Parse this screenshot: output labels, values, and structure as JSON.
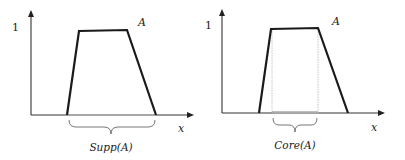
{
  "left_panel": {
    "y_tick_label": "1",
    "set_label": "A",
    "x_axis_label": "x",
    "brace_caption": "Supp(A)",
    "axis_origin": [
      31,
      115
    ],
    "y_axis_top": 11,
    "x_axis_end": 193,
    "trapezoid": {
      "bottom_left": [
        67,
        115
      ],
      "top_left": [
        79,
        31
      ],
      "top_right": [
        127,
        30
      ],
      "bottom_right": [
        156,
        115
      ]
    },
    "highlight_range": [
      67,
      156
    ]
  },
  "right_panel": {
    "y_tick_label": "1",
    "set_label": "A",
    "x_axis_label": "x",
    "brace_caption": "Core(A)",
    "axis_origin": [
      222,
      113
    ],
    "y_axis_top": 10,
    "x_axis_end": 384,
    "trapezoid": {
      "bottom_left": [
        259,
        113
      ],
      "top_left": [
        271,
        29
      ],
      "top_right": [
        318,
        28
      ],
      "bottom_right": [
        348,
        113
      ]
    },
    "highlight_range": [
      272,
      318
    ]
  },
  "colors": {
    "stroke": "#1a1a1a",
    "axis": "#333333",
    "highlight": "#a8a8a8",
    "guide": "#b5b5b5",
    "brace": "#666666"
  }
}
